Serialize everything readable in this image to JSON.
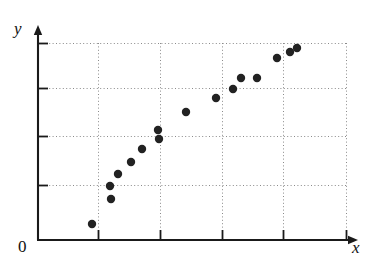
{
  "figure": {
    "kind": "scatter-plot",
    "background_color": "#ffffff",
    "axis_color": "#1a1a1a",
    "grid_color": "#8a8a8a",
    "point_color": "#222222"
  },
  "labels": {
    "y_axis": "y",
    "x_axis": "x",
    "origin": "0"
  },
  "axes": {
    "x_axis_y": 240,
    "y_axis_x": 38,
    "x_axis_start": 38,
    "x_axis_end": 358,
    "y_axis_top": 25,
    "y_axis_bottom": 240,
    "x_ticks": [
      98,
      160,
      222,
      283,
      346
    ],
    "y_ticks": [
      43,
      88,
      136,
      185
    ],
    "tick_length": 10,
    "grid": true
  },
  "chart_data": {
    "type": "scatter",
    "title": "",
    "xlabel": "x",
    "ylabel": "y",
    "grid": true,
    "legend": null,
    "xlim": [
      0,
      5.2
    ],
    "ylim": [
      0,
      4.4
    ],
    "x_tick_values": [
      1,
      2,
      3,
      4,
      5
    ],
    "y_tick_values": [
      1,
      2,
      3,
      4
    ],
    "x_tick_labels": [
      "",
      "",
      "",
      "",
      ""
    ],
    "y_tick_labels": [
      "",
      "",
      "",
      ""
    ],
    "points_px": [
      {
        "x": 92,
        "y": 224
      },
      {
        "x": 110,
        "y": 186
      },
      {
        "x": 111,
        "y": 199
      },
      {
        "x": 118,
        "y": 174
      },
      {
        "x": 131,
        "y": 162
      },
      {
        "x": 142,
        "y": 149
      },
      {
        "x": 158,
        "y": 130
      },
      {
        "x": 159,
        "y": 139
      },
      {
        "x": 186,
        "y": 112
      },
      {
        "x": 216,
        "y": 98
      },
      {
        "x": 233,
        "y": 89
      },
      {
        "x": 241,
        "y": 78
      },
      {
        "x": 257,
        "y": 78
      },
      {
        "x": 277,
        "y": 58
      },
      {
        "x": 290,
        "y": 52
      },
      {
        "x": 297,
        "y": 48
      }
    ],
    "x": [
      0.44,
      0.73,
      0.74,
      0.85,
      1.05,
      1.23,
      1.48,
      1.5,
      1.94,
      2.42,
      2.69,
      2.82,
      3.08,
      3.4,
      3.61,
      3.72
    ],
    "y": [
      0.32,
      1.12,
      0.86,
      1.36,
      1.59,
      1.86,
      2.24,
      2.06,
      2.6,
      2.88,
      3.06,
      3.29,
      3.29,
      3.7,
      3.83,
      3.91
    ],
    "point_radius": 4.2,
    "marker": "circle-filled"
  }
}
